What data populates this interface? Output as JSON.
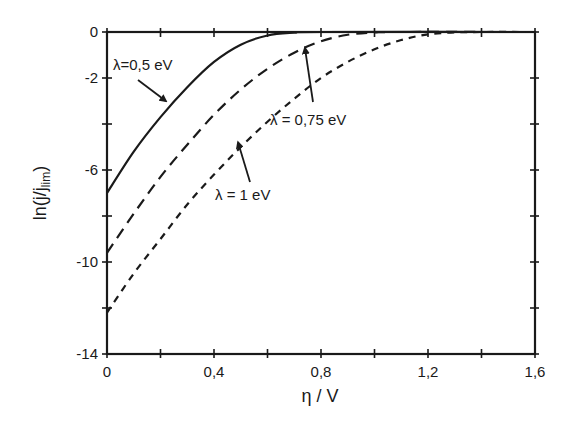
{
  "chart_data": {
    "type": "line",
    "title": "",
    "xlabel": "η / V",
    "ylabel": "ln(j/j_lim)",
    "ylabel_main": "ln(j/j",
    "ylabel_sub": "lim",
    "ylabel_close": ")",
    "xlim": [
      0,
      1.6
    ],
    "ylim": [
      -14,
      0
    ],
    "grid": false,
    "legend": "none (inline annotations with arrows)",
    "x_ticks": [
      0,
      0.2,
      0.4,
      0.6,
      0.8,
      1.0,
      1.2,
      1.4,
      1.6
    ],
    "x_tick_labels": [
      "0",
      "",
      "0,4",
      "",
      "0,8",
      "",
      "1,2",
      "",
      "1,6"
    ],
    "y_ticks": [
      0,
      -2,
      -4,
      -6,
      -8,
      -10,
      -12,
      -14
    ],
    "y_tick_labels": [
      "0",
      "-2",
      "",
      "-6",
      "",
      "-10",
      "",
      "-14"
    ],
    "series": [
      {
        "name": "λ=0,5 eV",
        "style": "solid",
        "x": [
          0,
          0.1,
          0.2,
          0.3,
          0.4,
          0.5,
          0.6,
          0.7,
          0.8,
          1.6
        ],
        "values": [
          -7.0,
          -5.2,
          -3.7,
          -2.4,
          -1.3,
          -0.55,
          -0.15,
          -0.03,
          0,
          0
        ]
      },
      {
        "name": "λ = 0,75 eV",
        "style": "long-dash",
        "x": [
          0,
          0.1,
          0.2,
          0.3,
          0.4,
          0.5,
          0.6,
          0.7,
          0.8,
          0.9,
          1.0,
          1.1,
          1.6
        ],
        "values": [
          -9.6,
          -7.9,
          -6.3,
          -4.9,
          -3.6,
          -2.5,
          -1.6,
          -0.9,
          -0.4,
          -0.12,
          -0.02,
          0,
          0
        ]
      },
      {
        "name": "λ = 1 eV",
        "style": "short-dash",
        "x": [
          0,
          0.1,
          0.2,
          0.3,
          0.4,
          0.5,
          0.6,
          0.7,
          0.8,
          0.9,
          1.0,
          1.1,
          1.2,
          1.3,
          1.4,
          1.6
        ],
        "values": [
          -12.2,
          -10.5,
          -9.0,
          -7.5,
          -6.2,
          -5.0,
          -3.9,
          -2.9,
          -2.0,
          -1.3,
          -0.75,
          -0.35,
          -0.1,
          -0.02,
          0,
          0
        ]
      }
    ],
    "annotations": [
      {
        "text": "λ=0,5 eV",
        "arrow_to": [
          0.22,
          -3.0
        ]
      },
      {
        "text": "λ = 0,75 eV",
        "arrow_to": [
          0.74,
          -0.7
        ]
      },
      {
        "text": "λ = 1 eV",
        "arrow_to": [
          0.49,
          -4.8
        ]
      }
    ]
  }
}
